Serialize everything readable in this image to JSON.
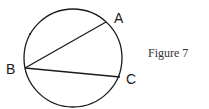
{
  "figure": {
    "caption": "Figure 7",
    "points": {
      "A": {
        "label": "A",
        "x": 106,
        "y": 22
      },
      "B": {
        "label": "B",
        "x": 25,
        "y": 68
      },
      "C": {
        "label": "C",
        "x": 120,
        "y": 77
      }
    },
    "circle": {
      "cx": 73,
      "cy": 58,
      "r": 49
    },
    "chords": [
      "BA",
      "BC"
    ],
    "stroke_color": "#1a1a1a"
  }
}
